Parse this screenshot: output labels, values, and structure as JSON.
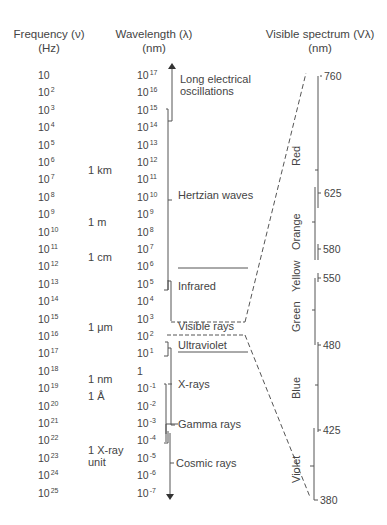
{
  "headers": {
    "frequency": {
      "title": "Frequency (ν)",
      "unit": "(Hz)"
    },
    "wavelength": {
      "title": "Wavelength (λ)",
      "unit": "(nm)"
    },
    "visible": {
      "title": "Visible spectrum (Vλ)",
      "unit": "(nm)"
    }
  },
  "frequency_ticks": [
    {
      "base": "10",
      "exp": ""
    },
    {
      "base": "10",
      "exp": "2"
    },
    {
      "base": "10",
      "exp": "3"
    },
    {
      "base": "10",
      "exp": "4"
    },
    {
      "base": "10",
      "exp": "5"
    },
    {
      "base": "10",
      "exp": "6"
    },
    {
      "base": "10",
      "exp": "7"
    },
    {
      "base": "10",
      "exp": "8"
    },
    {
      "base": "10",
      "exp": "9"
    },
    {
      "base": "10",
      "exp": "10"
    },
    {
      "base": "10",
      "exp": "11"
    },
    {
      "base": "10",
      "exp": "12"
    },
    {
      "base": "10",
      "exp": "13"
    },
    {
      "base": "10",
      "exp": "14"
    },
    {
      "base": "10",
      "exp": "15"
    },
    {
      "base": "10",
      "exp": "16"
    },
    {
      "base": "10",
      "exp": "17"
    },
    {
      "base": "10",
      "exp": "18"
    },
    {
      "base": "10",
      "exp": "19"
    },
    {
      "base": "10",
      "exp": "20"
    },
    {
      "base": "10",
      "exp": "21"
    },
    {
      "base": "10",
      "exp": "22"
    },
    {
      "base": "10",
      "exp": "23"
    },
    {
      "base": "10",
      "exp": "24"
    },
    {
      "base": "10",
      "exp": "25"
    }
  ],
  "wavelength_ticks": [
    {
      "base": "10",
      "exp": "17"
    },
    {
      "base": "10",
      "exp": "16"
    },
    {
      "base": "10",
      "exp": "15"
    },
    {
      "base": "10",
      "exp": "14"
    },
    {
      "base": "10",
      "exp": "13"
    },
    {
      "base": "10",
      "exp": "12"
    },
    {
      "base": "10",
      "exp": "11"
    },
    {
      "base": "10",
      "exp": "10"
    },
    {
      "base": "10",
      "exp": "9"
    },
    {
      "base": "10",
      "exp": "8"
    },
    {
      "base": "10",
      "exp": "7"
    },
    {
      "base": "10",
      "exp": "6"
    },
    {
      "base": "10",
      "exp": "5"
    },
    {
      "base": "10",
      "exp": "4"
    },
    {
      "base": "10",
      "exp": "3"
    },
    {
      "base": "10",
      "exp": "2"
    },
    {
      "base": "10",
      "exp": "1"
    },
    {
      "base": "1",
      "exp": ""
    },
    {
      "base": "10",
      "exp": "-1"
    },
    {
      "base": "10",
      "exp": "-2"
    },
    {
      "base": "10",
      "exp": "-3"
    },
    {
      "base": "10",
      "exp": "-4"
    },
    {
      "base": "10",
      "exp": "-5"
    },
    {
      "base": "10",
      "exp": "-6"
    },
    {
      "base": "10",
      "exp": "-7"
    }
  ],
  "unit_labels": [
    {
      "text": "1 km",
      "row": 5
    },
    {
      "text": "1 m",
      "row": 8
    },
    {
      "text": "1 cm",
      "row": 10
    },
    {
      "text": "1 μm",
      "row": 14
    },
    {
      "text": "1 nm",
      "row": 17
    },
    {
      "text": "1 Å",
      "row": 18
    },
    {
      "text": "1 X-ray",
      "row": 21
    },
    {
      "text": "unit",
      "row": 22
    }
  ],
  "bands": {
    "long_electrical_1": "Long electrical",
    "long_electrical_2": "oscillations",
    "hertzian": "Hertzian waves",
    "infrared": "Infrared",
    "visible": "Visible rays",
    "ultraviolet": "Ultraviolet",
    "xrays": "X-rays",
    "gamma": "Gamma rays",
    "cosmic": "Cosmic rays"
  },
  "visible_spectrum": {
    "ticks": [
      "760",
      "625",
      "580",
      "550",
      "480",
      "425",
      "380"
    ],
    "colors": [
      "Red",
      "Orange",
      "Yellow",
      "Green",
      "Blue",
      "Violet"
    ]
  }
}
